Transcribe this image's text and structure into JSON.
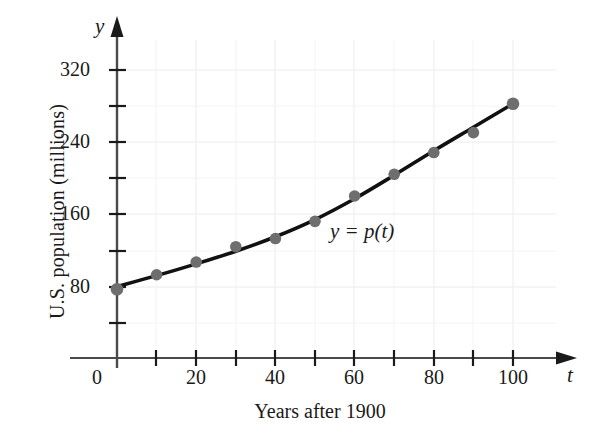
{
  "chart_data": {
    "type": "scatter",
    "title": "",
    "xlabel": "Years after 1900",
    "ylabel": "U.S. population (millions)",
    "x_axis_variable": "t",
    "y_axis_variable": "y",
    "annotation": "y = p(t)",
    "xlim": [
      0,
      110
    ],
    "ylim": [
      0,
      345
    ],
    "grid": true,
    "legend": "none",
    "x_ticks_major": [
      0,
      20,
      40,
      60,
      80,
      100
    ],
    "x_ticks_minor": [
      10,
      30,
      50,
      70,
      90
    ],
    "x_tick_labels": [
      "0",
      "20",
      "40",
      "60",
      "80",
      "100"
    ],
    "y_ticks_major": [
      80,
      160,
      240,
      320
    ],
    "y_ticks_minor": [
      40,
      120,
      200,
      280
    ],
    "y_tick_labels": [
      "80",
      "160",
      "240",
      "320"
    ],
    "x": [
      0,
      10,
      20,
      30,
      40,
      50,
      60,
      70,
      80,
      90,
      100
    ],
    "values": [
      76,
      92,
      106,
      123,
      132,
      151,
      179,
      203,
      227,
      249,
      281
    ],
    "series": [
      {
        "name": "U.S. population data points",
        "marker": "filled-circle",
        "color": "#6e6e6e",
        "values": [
          76,
          92,
          106,
          123,
          132,
          151,
          179,
          203,
          227,
          249,
          281
        ]
      },
      {
        "name": "y = p(t) fitted curve",
        "marker": "none",
        "color": "#111111",
        "curve_points": [
          [
            0,
            79
          ],
          [
            10,
            91
          ],
          [
            20,
            104
          ],
          [
            30,
            118
          ],
          [
            40,
            134
          ],
          [
            50,
            153
          ],
          [
            60,
            176
          ],
          [
            70,
            202
          ],
          [
            80,
            229
          ],
          [
            90,
            255
          ],
          [
            100,
            281
          ]
        ]
      }
    ],
    "colors": {
      "axis": "#4a4a4a",
      "curve": "#111111",
      "marker": "#6e6e6e",
      "grid": "#e8e8ee",
      "text": "#1a1a1a",
      "background": "#ffffff"
    }
  }
}
